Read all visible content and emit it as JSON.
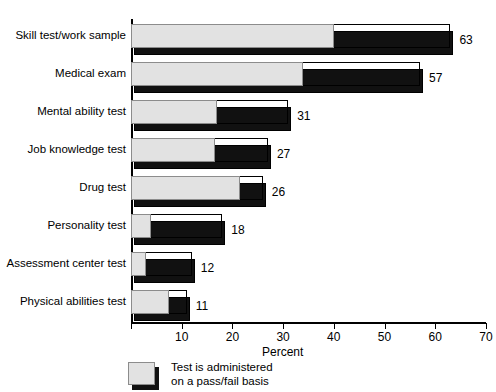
{
  "title_clipped": "ne million",
  "chart_data": {
    "type": "bar",
    "orientation": "horizontal",
    "title": "",
    "xlabel": "Percent",
    "ylabel": "",
    "xlim": [
      0,
      70
    ],
    "xticks": [
      0,
      10,
      20,
      30,
      40,
      50,
      60,
      70
    ],
    "xtick_labels": [
      "",
      "10",
      "20",
      "30",
      "40",
      "50",
      "60",
      "70"
    ],
    "grid": false,
    "legend_position": "bottom-center",
    "categories": [
      "Skill test/work sample",
      "Medical exam",
      "Mental ability test",
      "Job knowledge test",
      "Drug test",
      "Personality test",
      "Assessment center test",
      "Physical abilities test"
    ],
    "series": [
      {
        "name": "Total percent of establishments",
        "color": "#111111",
        "values": [
          63,
          57,
          31,
          27,
          26,
          18,
          12,
          11
        ]
      },
      {
        "name": "Test is administered on a pass/fail basis",
        "color": "#e2e2e2",
        "values": [
          40,
          34,
          17,
          16.5,
          21.5,
          4,
          3,
          7.5
        ]
      }
    ],
    "value_labels": [
      "63",
      "57",
      "31",
      "27",
      "26",
      "18",
      "12",
      "11"
    ]
  },
  "legend": {
    "line1": "Test is administered",
    "line2": "on a pass/fail basis",
    "swatch_color": "#e2e2e2",
    "shadow_color": "#111111"
  }
}
